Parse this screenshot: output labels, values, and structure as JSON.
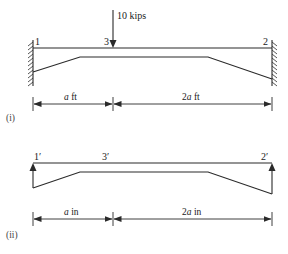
{
  "figure_i": {
    "id_label": "(i)",
    "node_labels": {
      "left": "1",
      "middle": "3",
      "right": "2"
    },
    "load": {
      "label": "10 kips",
      "direction": "down",
      "icon": "down-arrow-icon"
    },
    "supports": {
      "left": "fixed-wall",
      "right": "fixed-wall"
    },
    "dimensions": {
      "left_span": "a ft",
      "right_span": "2a ft"
    },
    "dimension_italic_parts": {
      "left": "a",
      "right": "2a"
    }
  },
  "figure_ii": {
    "id_label": "(ii)",
    "node_labels": {
      "left": "1′",
      "middle": "3′",
      "right": "2′"
    },
    "end_arrows": {
      "left": "up",
      "right": "up",
      "icon": "up-arrow-icon"
    },
    "dimensions": {
      "left_span": "a in",
      "right_span": "2a in"
    }
  },
  "colors": {
    "line": "#2a2a2a",
    "background": "#ffffff"
  }
}
